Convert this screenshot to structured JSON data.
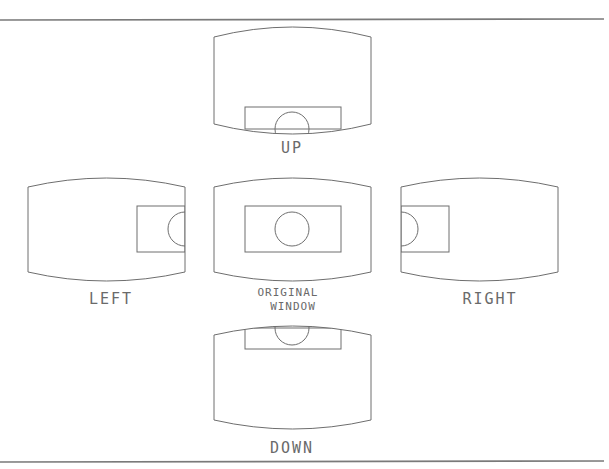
{
  "diagram": {
    "colors": {
      "line": "#6e6e6e",
      "frame": "#7a7a7a",
      "text": "#6a6a6a",
      "background": "#ffffff"
    },
    "frame": {
      "top_y": 20,
      "bottom_y": 462,
      "x1": 0,
      "x2": 604
    },
    "windows": [
      {
        "id": "up",
        "label": "UP",
        "label_line2": "",
        "x": 214,
        "y": 37,
        "w": 157,
        "h": 87,
        "bulge": 10,
        "inner": {
          "x": 245,
          "y": 107,
          "w": 96,
          "h": 22
        },
        "circle": {
          "cx": 292,
          "cy": 129,
          "r": 17,
          "clip": "top-half"
        }
      },
      {
        "id": "left",
        "label": "LEFT",
        "label_line2": "",
        "x": 28,
        "y": 187,
        "w": 157,
        "h": 85,
        "bulge": 9,
        "inner": {
          "x": 137,
          "y": 206,
          "w": 48,
          "h": 46
        },
        "circle": {
          "cx": 185,
          "cy": 229,
          "r": 17,
          "clip": "left-half"
        }
      },
      {
        "id": "original",
        "label": "ORIGINAL",
        "label_line2": " WINDOW",
        "x": 214,
        "y": 187,
        "w": 157,
        "h": 85,
        "bulge": 9,
        "inner": {
          "x": 245,
          "y": 206,
          "w": 96,
          "h": 46
        },
        "circle": {
          "cx": 292,
          "cy": 229,
          "r": 17,
          "clip": "full"
        }
      },
      {
        "id": "right",
        "label": "RIGHT",
        "label_line2": "",
        "x": 401,
        "y": 187,
        "w": 157,
        "h": 85,
        "bulge": 9,
        "inner": {
          "x": 401,
          "y": 206,
          "w": 48,
          "h": 46
        },
        "circle": {
          "cx": 401,
          "cy": 229,
          "r": 17,
          "clip": "right-half"
        }
      },
      {
        "id": "down",
        "label": "DOWN",
        "label_line2": "",
        "x": 214,
        "y": 335,
        "w": 157,
        "h": 85,
        "bulge": 9,
        "inner": {
          "x": 245,
          "y": 328,
          "w": 96,
          "h": 21
        },
        "circle": {
          "cx": 292,
          "cy": 328,
          "r": 17,
          "clip": "bottom-half"
        }
      }
    ],
    "labels": {
      "up": "UP",
      "left": "LEFT",
      "original_line1": "ORIGINAL",
      "original_line2": "WINDOW",
      "right": "RIGHT",
      "down": "DOWN"
    }
  }
}
